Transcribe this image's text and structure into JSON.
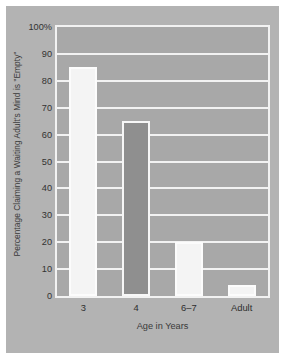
{
  "chart_data": {
    "type": "bar",
    "title": "",
    "subtitle": "",
    "xlabel": "Age in Years",
    "ylabel": "Percentage Claiming a Waiting Adult's Mind is \"Empty\"",
    "categories": [
      "3",
      "4",
      "6–7",
      "Adult"
    ],
    "values": [
      85,
      65,
      20,
      4
    ],
    "series": [
      {
        "name": "Percentage Claiming a Waiting Adult's Mind is \"Empty\"",
        "values": [
          85,
          65,
          20,
          4
        ]
      }
    ],
    "ylim": [
      0,
      100
    ],
    "xlim_categorical": true,
    "ytick_labels": [
      "100%",
      "90",
      "80",
      "70",
      "60",
      "50",
      "40",
      "30",
      "20",
      "10",
      "0"
    ],
    "ytick_values": [
      100,
      90,
      80,
      70,
      60,
      50,
      40,
      30,
      20,
      10,
      0
    ],
    "ytick_interval": 10,
    "grid": true,
    "grid_axis": "y",
    "legend": false,
    "legend_position": "none",
    "annotations": [],
    "bar_styles": [
      "light",
      "dark",
      "light",
      "light"
    ],
    "colors": {
      "plot_background": "#a8a8a8",
      "figure_background": "#b3b3b3",
      "page_background": "#ffffff",
      "gridline": "#f2f2f2",
      "axis_border": "#f2f2f2",
      "bar_light_fill": "#f4f4f4",
      "bar_light_edge": "#fcfcfc",
      "bar_dark_fill": "#8f8f8f",
      "bar_dark_edge": "#f7f7f7",
      "tick_text": "#323232",
      "axis_title_text": "#3a3a3a"
    }
  }
}
